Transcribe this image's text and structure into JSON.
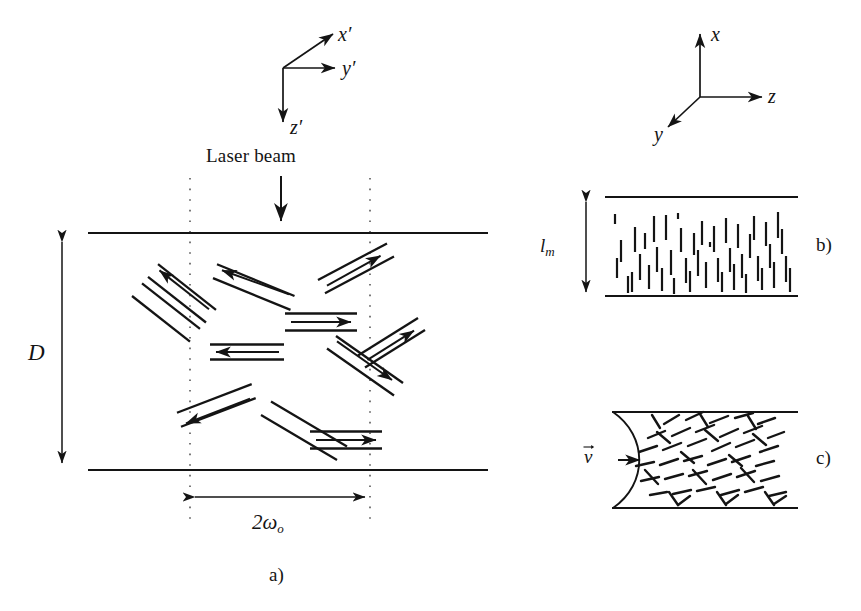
{
  "figure": {
    "caption_labels": {
      "panel_a": "a)",
      "panel_b": "b)",
      "panel_c": "c)"
    },
    "colors": {
      "ink": "#141414",
      "background": "#ffffff"
    }
  },
  "axes_primed": {
    "name": "primed-coordinate-axes",
    "origin": [
      283,
      68
    ],
    "labels": {
      "x": "x′",
      "y": "y′",
      "z": "z′"
    },
    "directions": {
      "x": "up-right diagonal",
      "y": "right horizontal",
      "z": "down vertical"
    }
  },
  "axes_lab": {
    "name": "lab-coordinate-axes",
    "origin": [
      700,
      73
    ],
    "labels": {
      "x": "x",
      "z": "z",
      "y": "y"
    },
    "directions": {
      "x": "up vertical",
      "z": "right horizontal",
      "y": "down-left diagonal"
    }
  },
  "panel_a": {
    "name": "laser-beam-cell-diagram",
    "beam_label": "Laser beam",
    "beam_arrow": {
      "x": 281,
      "y_start": 176,
      "y_end": 222
    },
    "walls": {
      "top_y": 233,
      "bottom_y": 470,
      "x_start": 88,
      "x_end": 488
    },
    "beam_dotted_lines": {
      "x_left": 190,
      "x_right": 370
    },
    "gap_label": "D",
    "gap_dimension": {
      "x": 62,
      "y_top": 237,
      "y_bottom": 468
    },
    "waist_label": "2ω",
    "waist_label_sub": "o",
    "waist_dimension": {
      "y": 497,
      "x_left": 190,
      "x_right": 370
    },
    "domains": [
      {
        "id": 1,
        "cx": 188,
        "cy": 287,
        "angle": 218,
        "len": 74,
        "gap": 13
      },
      {
        "id": 2,
        "cx": 179,
        "cy": 307,
        "angle": 218,
        "len": 74,
        "gap": 13
      },
      {
        "id": 3,
        "cx": 255,
        "cy": 280,
        "angle": 203,
        "len": 82,
        "gap": 15
      },
      {
        "id": 4,
        "cx": 352,
        "cy": 262,
        "angle": 28,
        "len": 78,
        "gap": 15
      },
      {
        "id": 5,
        "cx": 321,
        "cy": 322,
        "angle": 0,
        "len": 72,
        "gap": 17
      },
      {
        "id": 6,
        "cx": 247,
        "cy": 352,
        "angle": 180,
        "len": 74,
        "gap": 15
      },
      {
        "id": 7,
        "cx": 390,
        "cy": 336,
        "angle": 32,
        "len": 70,
        "gap": 14
      },
      {
        "id": 8,
        "cx": 361,
        "cy": 372,
        "angle": 325,
        "len": 82,
        "gap": 15
      },
      {
        "id": 9,
        "cx": 218,
        "cy": 411,
        "angle": 201,
        "len": 80,
        "gap": 16
      },
      {
        "id": 10,
        "cx": 307,
        "cy": 424,
        "angle": 330,
        "len": 88,
        "gap": 16
      },
      {
        "id": 11,
        "cx": 345,
        "cy": 440,
        "angle": 0,
        "len": 76,
        "gap": 17
      }
    ]
  },
  "panel_b": {
    "name": "aligned-rods-slab",
    "label": "b)",
    "height_label": "l",
    "height_label_sub": "m",
    "walls": {
      "top_y": 197,
      "bottom_y": 296,
      "x_start": 605,
      "x_end": 798
    },
    "dimension": {
      "x": 586,
      "y_top": 198,
      "y_bottom": 297
    },
    "rod_orientation": "vertical",
    "rod_count": 44
  },
  "panel_c": {
    "name": "flow-aligned-rods-channel",
    "label": "c)",
    "velocity_label": "v",
    "velocity_arrow": "→",
    "walls": {
      "top_y": 412,
      "bottom_y": 508,
      "x_start": 612,
      "x_end": 798
    },
    "flow_profile": "parabolic leading edge",
    "rod_orientation": "tilted, flow-aligned",
    "rod_count": 52
  }
}
